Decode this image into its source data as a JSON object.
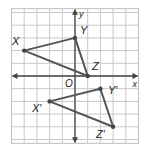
{
  "diagram": {
    "type": "coordinate-grid-translation",
    "grid": {
      "cols": 10,
      "rows": 11,
      "cell_px": 12.7,
      "origin_px": [
        75,
        76
      ],
      "line_color": "#c8c8c8",
      "border_color": "#bdbdbd"
    },
    "axes": {
      "x_label": "x",
      "y_label": "y",
      "origin_label": "O",
      "color": "#444444"
    },
    "preimage": {
      "color": "#555555",
      "vertices": [
        {
          "name": "X",
          "label": "X",
          "coord": [
            -4,
            2
          ]
        },
        {
          "name": "Y",
          "label": "Y",
          "coord": [
            0,
            3
          ]
        },
        {
          "name": "Z",
          "label": "Z",
          "coord": [
            1,
            0
          ]
        }
      ]
    },
    "image": {
      "color": "#555555",
      "vertices": [
        {
          "name": "X'",
          "label": "X′",
          "coord": [
            -2,
            -2
          ]
        },
        {
          "name": "Y'",
          "label": "Y′",
          "coord": [
            2,
            -1
          ]
        },
        {
          "name": "Z'",
          "label": "Z′",
          "coord": [
            3,
            -4
          ]
        }
      ]
    },
    "translation": [
      2,
      -4
    ]
  }
}
